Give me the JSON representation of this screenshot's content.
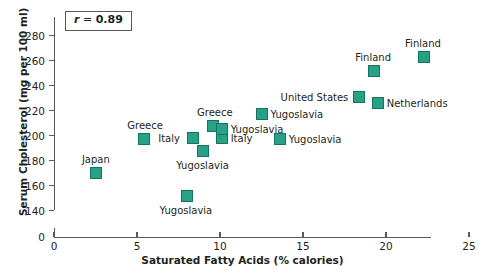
{
  "chart_data": {
    "type": "scatter",
    "title": "",
    "xlabel": "Saturated Fatty Acids (% calories)",
    "ylabel": "Serum Cholesterol (mg per 100 ml)",
    "xlim": [
      0,
      25
    ],
    "ylim": [
      140,
      280
    ],
    "y_axis_break": true,
    "y_zero_shown": true,
    "xticks": [
      0,
      5,
      10,
      15,
      20,
      25
    ],
    "yticks": [
      0,
      140,
      160,
      180,
      200,
      220,
      240,
      260,
      280
    ],
    "grid": false,
    "legend": "none",
    "annotation": {
      "text": "r = 0.89",
      "symbol": "r",
      "operator": "=",
      "value": "0.89"
    },
    "marker_color": "#27a287",
    "marker_edge_color": "#14755f",
    "points": [
      {
        "label": "Japan",
        "x": 2.5,
        "y": 170,
        "label_pos": "above"
      },
      {
        "label": "Greece",
        "x": 5.4,
        "y": 197,
        "label_pos": "above"
      },
      {
        "label": "Yugoslavia",
        "x": 8.0,
        "y": 152,
        "label_pos": "below"
      },
      {
        "label": "Greece",
        "x": 9.6,
        "y": 208,
        "label_pos": "above"
      },
      {
        "label": "Italy",
        "x": 8.4,
        "y": 198,
        "label_pos": "left"
      },
      {
        "label": "Italy",
        "x": 10.1,
        "y": 198,
        "label_pos": "right"
      },
      {
        "label": "Yugoslavia",
        "x": 9.0,
        "y": 188,
        "label_pos": "below"
      },
      {
        "label": "Yugoslavia",
        "x": 10.1,
        "y": 205,
        "label_pos": "right"
      },
      {
        "label": "Yugoslavia",
        "x": 12.5,
        "y": 217,
        "label_pos": "right"
      },
      {
        "label": "Yugoslavia",
        "x": 13.6,
        "y": 197,
        "label_pos": "right"
      },
      {
        "label": "United States",
        "x": 18.4,
        "y": 231,
        "label_pos": "left"
      },
      {
        "label": "Netherlands",
        "x": 19.5,
        "y": 226,
        "label_pos": "right"
      },
      {
        "label": "Finland",
        "x": 19.3,
        "y": 252,
        "label_pos": "above"
      },
      {
        "label": "Finland",
        "x": 22.3,
        "y": 263,
        "label_pos": "above"
      }
    ]
  },
  "axes": {
    "x_title": "Saturated Fatty Acids (% calories)",
    "y_title": "Serum Cholesterol (mg per 100 ml)",
    "x_tick_labels": [
      "0",
      "5",
      "10",
      "15",
      "20",
      "25"
    ],
    "y_tick_labels": [
      "0",
      "140",
      "160",
      "180",
      "200",
      "220",
      "240",
      "260",
      "280"
    ]
  },
  "annotation_text": "r = 0.89"
}
